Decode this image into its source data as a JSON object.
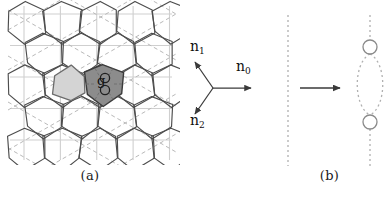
{
  "figure": {
    "panels": [
      {
        "id": "a",
        "caption": "(a)"
      },
      {
        "id": "b",
        "caption": "(b)"
      }
    ]
  },
  "panel_a": {
    "name": "hexagonal-lattice-diagram",
    "highlighted_cell_label": "g",
    "lattice": {
      "type": "honeycomb",
      "rows": 7,
      "cols": 5,
      "hex_radius": 21,
      "origin_x": 18,
      "origin_y": 10
    },
    "colors": {
      "cell_outline": "#4d4d4d",
      "grid_line": "#cfcfcf",
      "dashed_line": "#b9b9b9",
      "dark_cell_fill": "#8c8c8c",
      "dark_cell_stroke": "#3b3b3b",
      "light_cell_fill": "#d4d4d4",
      "light_cell_stroke": "#6b6b6b",
      "dot_stroke": "#1f1f1f"
    },
    "dark_cell": {
      "label": "g",
      "marker_count": 2,
      "marker_shape": "circle"
    },
    "light_cell": {
      "marker_count": 0
    }
  },
  "panel_vectors": {
    "name": "basis-vector-triad",
    "origin": {
      "x": 33,
      "y": 88
    },
    "vectors": [
      {
        "id": "n1",
        "label": "n",
        "subscript": "1",
        "angle_deg": 125,
        "length": 32,
        "tip_x": 15,
        "tip_y": 62
      },
      {
        "id": "n0",
        "label": "n",
        "subscript": "0",
        "angle_deg": 0,
        "length": 38,
        "tip_x": 71,
        "tip_y": 88
      },
      {
        "id": "n2",
        "label": "n",
        "subscript": "2",
        "angle_deg": 235,
        "length": 32,
        "tip_x": 15,
        "tip_y": 114
      }
    ],
    "color": "#3a3a3a"
  },
  "panel_b": {
    "name": "string-splitting-diagram",
    "left_line": {
      "type": "dotted-vertical-line",
      "x": 18,
      "y_top": 15,
      "y_bottom": 166
    },
    "arrow": {
      "x_start": 30,
      "x_end": 70,
      "y": 88,
      "direction": "right"
    },
    "right_structure": {
      "x": 100,
      "y_top": 15,
      "y_bottom": 166,
      "circles": [
        {
          "cx": 100,
          "cy": 47,
          "r": 7
        },
        {
          "cx": 100,
          "cy": 122,
          "r": 7
        }
      ],
      "lens_half_width": 17
    },
    "colors": {
      "dotted_line": "#b0b0b0",
      "arrow": "#3a3a3a",
      "circle_stroke": "#8a8a8a",
      "lens_stroke": "#b0b0b0"
    }
  }
}
